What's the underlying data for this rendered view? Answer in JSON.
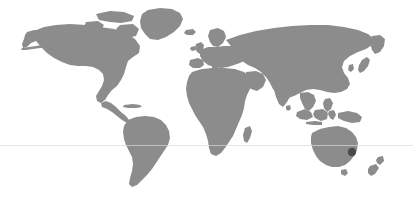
{
  "figure": {
    "type": "world-map",
    "background_color": "#ffffff",
    "land_color": "#8c8c8c",
    "graticule_color": "#d8d8d8",
    "marker_color": "#4a4a4a",
    "width": 413,
    "height": 202
  },
  "graticule": {
    "equator_label": "Equator",
    "visible": true,
    "y": 145.5
  },
  "markers": [
    {
      "name": "Sydney",
      "region": "Australia",
      "x": 352,
      "y": 152,
      "radius": 4.2,
      "color": "#4a4a4a"
    }
  ],
  "continents": [
    {
      "name": "North America"
    },
    {
      "name": "South America"
    },
    {
      "name": "Greenland"
    },
    {
      "name": "Europe"
    },
    {
      "name": "Africa"
    },
    {
      "name": "Asia"
    },
    {
      "name": "Australia"
    },
    {
      "name": "New Zealand"
    },
    {
      "name": "Indonesia"
    },
    {
      "name": "Japan"
    },
    {
      "name": "Madagascar"
    },
    {
      "name": "United Kingdom"
    }
  ]
}
